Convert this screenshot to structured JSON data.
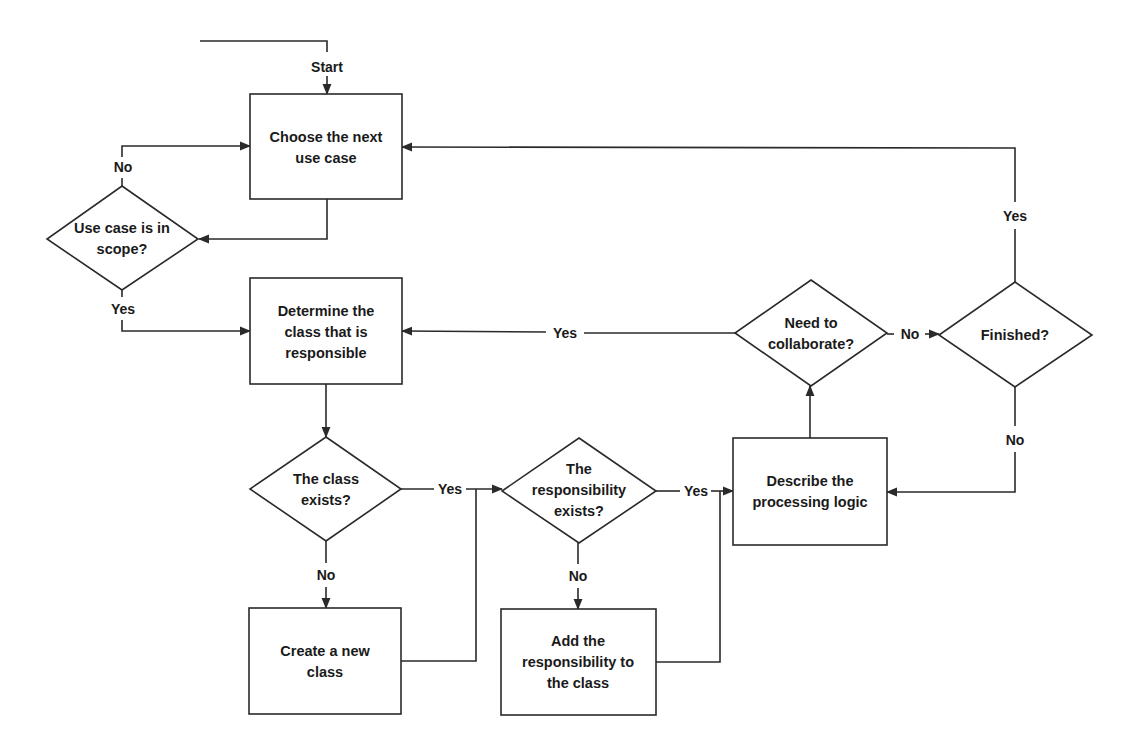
{
  "diagram": {
    "type": "flowchart",
    "start_label": "Start",
    "nodes": {
      "choose_use_case": {
        "kind": "process",
        "lines": [
          "Choose the next",
          "use case"
        ]
      },
      "in_scope": {
        "kind": "decision",
        "lines": [
          "Use case is in",
          "scope?"
        ]
      },
      "determine_class": {
        "kind": "process",
        "lines": [
          "Determine the",
          "class that is",
          "responsible"
        ]
      },
      "class_exists": {
        "kind": "decision",
        "lines": [
          "The class",
          "exists?"
        ]
      },
      "create_class": {
        "kind": "process",
        "lines": [
          "Create a new",
          "class"
        ]
      },
      "resp_exists": {
        "kind": "decision",
        "lines": [
          "The",
          "responsibility",
          "exists?"
        ]
      },
      "add_resp": {
        "kind": "process",
        "lines": [
          "Add the",
          "responsibility to",
          "the class"
        ]
      },
      "describe_logic": {
        "kind": "process",
        "lines": [
          "Describe the",
          "processing logic"
        ]
      },
      "need_collab": {
        "kind": "decision",
        "lines": [
          "Need to",
          "collaborate?"
        ]
      },
      "finished": {
        "kind": "decision",
        "lines": [
          "Finished?"
        ]
      }
    },
    "edge_labels": {
      "in_scope_no": "No",
      "in_scope_yes": "Yes",
      "class_exists_yes": "Yes",
      "class_exists_no": "No",
      "resp_exists_yes": "Yes",
      "resp_exists_no": "No",
      "need_collab_yes": "Yes",
      "need_collab_no": "No",
      "finished_yes": "Yes",
      "finished_no": "No"
    },
    "edges": [
      {
        "from": "start",
        "to": "choose_use_case"
      },
      {
        "from": "choose_use_case",
        "to": "in_scope"
      },
      {
        "from": "in_scope",
        "to": "choose_use_case",
        "label": "No"
      },
      {
        "from": "in_scope",
        "to": "determine_class",
        "label": "Yes"
      },
      {
        "from": "determine_class",
        "to": "class_exists"
      },
      {
        "from": "class_exists",
        "to": "resp_exists",
        "label": "Yes"
      },
      {
        "from": "class_exists",
        "to": "create_class",
        "label": "No"
      },
      {
        "from": "create_class",
        "to": "resp_exists"
      },
      {
        "from": "resp_exists",
        "to": "describe_logic",
        "label": "Yes"
      },
      {
        "from": "resp_exists",
        "to": "add_resp",
        "label": "No"
      },
      {
        "from": "add_resp",
        "to": "describe_logic"
      },
      {
        "from": "describe_logic",
        "to": "need_collab"
      },
      {
        "from": "need_collab",
        "to": "determine_class",
        "label": "Yes"
      },
      {
        "from": "need_collab",
        "to": "finished",
        "label": "No"
      },
      {
        "from": "finished",
        "to": "choose_use_case",
        "label": "Yes"
      },
      {
        "from": "finished",
        "to": "describe_logic",
        "label": "No"
      }
    ]
  }
}
